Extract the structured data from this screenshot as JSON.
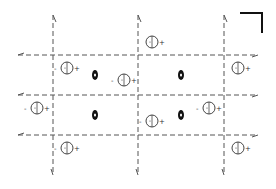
{
  "diagram": {
    "type": "space-group-symmetry-diagram",
    "colors": {
      "line": "#555555",
      "symbol": "#111111",
      "circle": "#444444",
      "background": "#ffffff"
    },
    "vertical_glide_lines_x": [
      53,
      138,
      224
    ],
    "horizontal_glide_lines_y": [
      55,
      95,
      135
    ],
    "line_extent": {
      "x_min": 18,
      "x_max": 258,
      "y_min": 15,
      "y_max": 175
    },
    "origin_corner_mark": {
      "x1": 240,
      "y1": 13,
      "x2": 262,
      "y2": 13,
      "x3": 262,
      "y3": 33
    },
    "two_fold_screw_axes": [
      {
        "x": 95,
        "y": 75
      },
      {
        "x": 181,
        "y": 75
      },
      {
        "x": 95,
        "y": 115
      },
      {
        "x": 181,
        "y": 115
      }
    ],
    "atom_positions": [
      {
        "x": 67,
        "y": 68,
        "left_sign": "-",
        "right_sign": "+"
      },
      {
        "x": 124,
        "y": 80,
        "left_sign": "-",
        "right_sign": "+"
      },
      {
        "x": 152,
        "y": 42,
        "left_sign": "",
        "right_sign": "+"
      },
      {
        "x": 238,
        "y": 68,
        "left_sign": "",
        "right_sign": "+"
      },
      {
        "x": 37,
        "y": 108,
        "left_sign": "-",
        "right_sign": "+"
      },
      {
        "x": 152,
        "y": 121,
        "left_sign": "-",
        "right_sign": "+"
      },
      {
        "x": 209,
        "y": 108,
        "left_sign": "-",
        "right_sign": "+"
      },
      {
        "x": 67,
        "y": 148,
        "left_sign": "-",
        "right_sign": "+"
      },
      {
        "x": 238,
        "y": 148,
        "left_sign": "",
        "right_sign": "+"
      }
    ]
  }
}
